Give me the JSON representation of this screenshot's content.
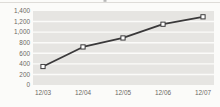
{
  "chart_data": {
    "type": "line",
    "title": "",
    "xlabel": "",
    "ylabel": "",
    "categories": [
      "12/03",
      "12/04",
      "12/05",
      "12/06",
      "12/07"
    ],
    "values": [
      350,
      720,
      890,
      1150,
      1290
    ],
    "series": [
      {
        "name": "value",
        "values": [
          350,
          720,
          890,
          1150,
          1290
        ]
      }
    ],
    "ylim": [
      0,
      1400
    ],
    "ytick_step": 200,
    "ytick_labels": [
      "0",
      "200",
      "400",
      "600",
      "800",
      "1,000",
      "1,200",
      "1,400"
    ],
    "grid": "horizontal white gridlines over gray plot-area bands",
    "legend": "none",
    "marker": "square-open",
    "colors": {
      "background": "#fbfbf9",
      "plot_band": "#e6e5e2",
      "gridline": "#fbfbf9",
      "line": "#3a393a",
      "marker_fill": "#ffffff",
      "marker_stroke": "#3a393a",
      "tick_label": "#6b6862",
      "top_rule": "#d8d6d2",
      "scan_artifact": "#8c8c8c"
    }
  },
  "layout": {
    "width": 220,
    "height": 107,
    "plot": {
      "left": 33,
      "right": 214,
      "top": 11,
      "bottom": 85
    },
    "x_label_y": 95,
    "first_point_x": 43,
    "point_spacing": 40
  }
}
